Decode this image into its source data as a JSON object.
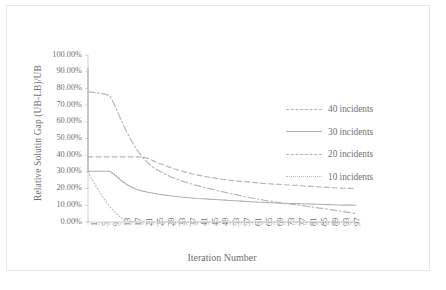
{
  "chart_data": {
    "type": "line",
    "title": "",
    "xlabel": "Iteration Number",
    "ylabel": "Relative Solutin Gap (UB-LB)/UB",
    "ylim": [
      0,
      100
    ],
    "xlim": [
      1,
      99
    ],
    "grid": false,
    "legend_position": "right",
    "y_tick_labels": [
      "100.00%",
      "90.00%",
      "80.00%",
      "70.00%",
      "60.00%",
      "50.00%",
      "40.00%",
      "30.00%",
      "20.00%",
      "10.00%",
      "0.00%"
    ],
    "y_tick_values": [
      100,
      90,
      80,
      70,
      60,
      50,
      40,
      30,
      20,
      10,
      0
    ],
    "x_tick_labels": [
      "1",
      "5",
      "9",
      "13",
      "17",
      "21",
      "25",
      "29",
      "33",
      "37",
      "41",
      "45",
      "49",
      "53",
      "57",
      "61",
      "65",
      "69",
      "73",
      "77",
      "81",
      "85",
      "89",
      "93",
      "97"
    ],
    "x_tick_values": [
      1,
      5,
      9,
      13,
      17,
      21,
      25,
      29,
      33,
      37,
      41,
      45,
      49,
      53,
      57,
      61,
      65,
      69,
      73,
      77,
      81,
      85,
      89,
      93,
      97
    ],
    "series": [
      {
        "name": "40 incidents",
        "style": "dashed",
        "color": "#b4b4b4",
        "x": [
          1,
          3,
          5,
          7,
          9,
          11,
          13,
          15,
          17,
          19,
          21,
          23,
          25,
          27,
          29,
          31,
          33,
          35,
          37,
          39,
          41,
          43,
          45,
          47,
          49,
          51,
          53,
          55,
          57,
          59,
          61,
          63,
          65,
          67,
          69,
          71,
          73,
          75,
          77,
          79,
          81,
          83,
          85,
          87,
          89,
          91,
          93,
          95,
          97,
          99
        ],
        "values": [
          39.0,
          39.0,
          39.0,
          39.0,
          39.0,
          39.0,
          39.0,
          39.0,
          39.0,
          39.0,
          38.9,
          38.0,
          36.6,
          35.2,
          33.9,
          32.7,
          31.6,
          30.6,
          29.7,
          28.9,
          28.2,
          27.5,
          26.9,
          26.4,
          25.9,
          25.4,
          25.0,
          24.6,
          24.3,
          24.0,
          23.7,
          23.4,
          23.1,
          22.9,
          22.7,
          22.5,
          22.3,
          22.1,
          21.9,
          21.7,
          21.5,
          21.3,
          21.1,
          20.9,
          20.7,
          20.5,
          20.3,
          20.2,
          20.1,
          20.0
        ]
      },
      {
        "name": "30 incidents",
        "style": "solid",
        "color": "#b0b0b0",
        "x": [
          1,
          3,
          5,
          7,
          9,
          11,
          13,
          15,
          17,
          19,
          21,
          23,
          25,
          27,
          29,
          31,
          33,
          35,
          37,
          39,
          41,
          43,
          45,
          47,
          49,
          51,
          53,
          55,
          57,
          59,
          61,
          63,
          65,
          67,
          69,
          71,
          73,
          75,
          77,
          79,
          81,
          83,
          85,
          87,
          89,
          91,
          93,
          95,
          97,
          99
        ],
        "values": [
          30.4,
          30.4,
          30.4,
          30.4,
          30.4,
          28.0,
          25.0,
          22.6,
          20.8,
          19.5,
          18.5,
          17.8,
          17.2,
          16.6,
          16.1,
          15.7,
          15.3,
          15.0,
          14.7,
          14.4,
          14.1,
          13.9,
          13.7,
          13.5,
          13.3,
          13.1,
          12.9,
          12.7,
          12.5,
          12.3,
          12.1,
          11.9,
          11.8,
          11.6,
          11.5,
          11.3,
          11.2,
          11.1,
          11.0,
          10.9,
          10.8,
          10.7,
          10.6,
          10.5,
          10.4,
          10.3,
          10.2,
          10.1,
          10.1,
          10.0
        ]
      },
      {
        "name": "20 incidents",
        "style": "dashdot",
        "color": "#b4b4b4",
        "x": [
          1,
          3,
          5,
          7,
          9,
          11,
          13,
          15,
          17,
          19,
          21,
          23,
          25,
          27,
          29,
          31,
          33,
          35,
          37,
          39,
          41,
          43,
          45,
          47,
          49,
          51,
          53,
          55,
          57,
          59,
          61,
          63,
          65,
          67,
          69,
          71,
          73,
          75,
          77,
          79,
          81,
          83,
          85,
          87,
          89,
          91,
          93,
          95,
          97,
          99
        ],
        "values": [
          78.0,
          77.6,
          77.2,
          76.6,
          75.8,
          69.0,
          61.5,
          54.5,
          48.2,
          43.0,
          38.6,
          35.2,
          32.6,
          30.5,
          28.8,
          27.3,
          26.0,
          24.8,
          23.7,
          22.7,
          21.8,
          20.9,
          20.1,
          19.3,
          18.5,
          17.8,
          17.1,
          16.4,
          15.7,
          15.0,
          14.4,
          13.8,
          13.2,
          12.6,
          12.1,
          11.6,
          11.1,
          10.7,
          10.3,
          9.9,
          9.4,
          9.0,
          8.5,
          8.1,
          7.6,
          7.1,
          6.6,
          6.1,
          5.6,
          5.0
        ]
      },
      {
        "name": "10 incidents",
        "style": "dotted",
        "color": "#bcbcbc",
        "x": [
          1,
          3,
          5,
          7,
          9,
          11,
          13,
          15,
          17,
          19,
          21,
          23,
          25,
          27,
          29,
          31,
          33,
          35,
          37,
          39,
          41,
          43,
          45,
          47,
          49,
          51,
          53,
          55,
          57,
          59,
          61,
          63,
          65,
          67,
          69,
          71,
          73,
          75,
          77,
          79,
          81,
          83,
          85,
          87,
          89,
          91,
          93,
          95,
          97,
          99
        ],
        "values": [
          30.2,
          24.0,
          18.5,
          13.5,
          9.2,
          5.6,
          2.6,
          0.8,
          0.2,
          0.0,
          0.0,
          0.0,
          0.0,
          0.0,
          0.0,
          0.0,
          0.0,
          0.0,
          0.0,
          0.0,
          0.0,
          0.0,
          0.0,
          0.0,
          0.0,
          0.0,
          0.0,
          0.0,
          0.0,
          0.0,
          0.0,
          0.0,
          0.0,
          0.0,
          0.0,
          0.0,
          0.0,
          0.0,
          0.0,
          0.0,
          0.0,
          0.0,
          0.0,
          0.0,
          0.0,
          0.0,
          0.0,
          0.0,
          0.0,
          0.0
        ]
      },
      {
        "name": "initial spike",
        "style": "solid",
        "color": "#b0b0b0",
        "x": [
          1,
          1
        ],
        "values": [
          92.0,
          30.4
        ]
      }
    ],
    "legend": [
      "40 incidents",
      "30 incidents",
      "20 incidents",
      "10 incidents"
    ],
    "axis_color": "#c8c8c8"
  }
}
